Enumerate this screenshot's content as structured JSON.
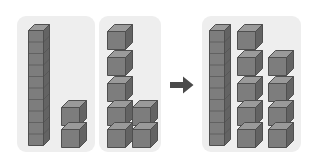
{
  "illustration": {
    "title": "Base-ten blocks addition",
    "type": "base-ten-block-diagram",
    "description": "Twelve shown as one ten-rod and two unit cubes, plus seven unit cubes, equals nineteen shown as one ten-rod and nine unit cubes.",
    "background_color": "#ffffff"
  },
  "colors": {
    "panel_fill": "#eeeeee",
    "block_top": "#9a9a9a",
    "block_front": "#7d7d7d",
    "block_side": "#636363",
    "block_outline": "#4f4f4f",
    "arrow": "#4a4a4a"
  },
  "panels": [
    {
      "name": "first-addend",
      "value": 12,
      "rods": 1,
      "rod_units_per_rod": 10,
      "units": 2,
      "rod_positions": [
        {
          "x": 11,
          "y": 8
        }
      ],
      "unit_positions": [
        {
          "x": 44,
          "y": 84
        },
        {
          "x": 44,
          "y": 106
        }
      ]
    },
    {
      "name": "second-addend",
      "value": 7,
      "rods": 0,
      "rod_units_per_rod": 10,
      "units": 7,
      "rod_positions": [],
      "unit_positions": [
        {
          "x": 8,
          "y": 8
        },
        {
          "x": 8,
          "y": 34
        },
        {
          "x": 8,
          "y": 60
        },
        {
          "x": 8,
          "y": 84
        },
        {
          "x": 8,
          "y": 106
        },
        {
          "x": 33,
          "y": 84
        },
        {
          "x": 33,
          "y": 106
        }
      ]
    },
    {
      "name": "sum",
      "value": 19,
      "rods": 1,
      "rod_units_per_rod": 10,
      "units": 9,
      "rod_positions": [
        {
          "x": 7,
          "y": 8
        }
      ],
      "unit_positions": [
        {
          "x": 35,
          "y": 8
        },
        {
          "x": 35,
          "y": 34
        },
        {
          "x": 35,
          "y": 60
        },
        {
          "x": 35,
          "y": 84
        },
        {
          "x": 35,
          "y": 106
        },
        {
          "x": 66,
          "y": 34
        },
        {
          "x": 66,
          "y": 60
        },
        {
          "x": 66,
          "y": 84
        },
        {
          "x": 66,
          "y": 106
        }
      ]
    }
  ],
  "arrow": {
    "name": "equals-arrow",
    "direction": "right",
    "glyph": "arrow-right"
  }
}
